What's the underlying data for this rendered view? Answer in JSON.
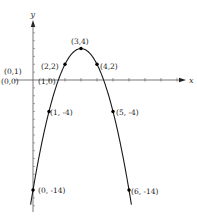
{
  "chart_data": {
    "type": "line",
    "title": "",
    "xlabel": "x",
    "ylabel": "y",
    "function": "y = -2(x-3)^2 + 4",
    "xlim": [
      -0.2,
      9.8
    ],
    "ylim": [
      -16.5,
      7.5
    ],
    "grid": false,
    "legend": null,
    "points": [
      {
        "x": 0,
        "y": 0,
        "label": "(0,0)"
      },
      {
        "x": 0,
        "y": 1,
        "label": "(0,1)"
      },
      {
        "x": 1,
        "y": 0,
        "label": "(1,0)"
      },
      {
        "x": 2,
        "y": 2,
        "label": "(2,2)"
      },
      {
        "x": 3,
        "y": 4,
        "label": "(3,4)"
      },
      {
        "x": 4,
        "y": 2,
        "label": "(4,2)"
      },
      {
        "x": 1,
        "y": -4,
        "label": "(1, -4)"
      },
      {
        "x": 5,
        "y": -4,
        "label": "(5, -4)"
      },
      {
        "x": 0,
        "y": -14,
        "label": "(0, -14)"
      },
      {
        "x": 6,
        "y": -14,
        "label": "(6, -14)"
      }
    ],
    "marked_points": [
      "(2,2)",
      "(3,4)",
      "(4,2)",
      "(1, -4)",
      "(5, -4)",
      "(0, -14)",
      "(6, -14)"
    ],
    "colors": {
      "curve": "#1a1a1a",
      "axis": "#555555",
      "point": "#000000"
    }
  }
}
